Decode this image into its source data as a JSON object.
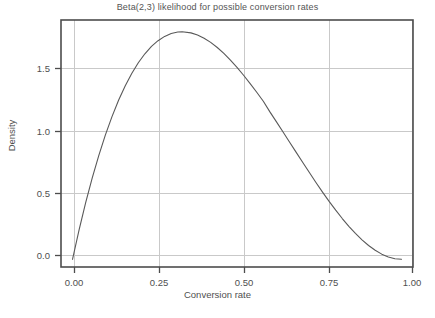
{
  "chart_data": {
    "type": "line",
    "title": "Beta(2,3) likelihood for possible conversion rates",
    "xlabel": "Conversion rate",
    "ylabel": "Density",
    "xlim": [
      -0.035,
      1.035
    ],
    "ylim": [
      -0.06,
      1.87
    ],
    "grid": true,
    "legend": null,
    "distribution": {
      "name": "Beta",
      "alpha": 2,
      "beta": 3
    },
    "xticks": [
      0,
      0.25,
      0.5,
      0.75,
      1
    ],
    "xtick_labels": [
      "0.00",
      "0.25",
      "0.50",
      "0.75",
      "1.00"
    ],
    "yticks": [
      0,
      0.5,
      1,
      1.5
    ],
    "ytick_labels": [
      "0.0",
      "0.5",
      "1.0",
      "1.5"
    ],
    "series": [
      {
        "name": "Beta(2,3) density",
        "color": "#595959",
        "x": [
          0,
          0.02,
          0.04,
          0.06,
          0.08,
          0.1,
          0.12,
          0.14,
          0.16,
          0.18,
          0.2,
          0.22,
          0.24,
          0.26,
          0.28,
          0.3,
          0.32,
          0.3333,
          0.36,
          0.38,
          0.4,
          0.42,
          0.44,
          0.46,
          0.48,
          0.5,
          0.52,
          0.54,
          0.56,
          0.58,
          0.6,
          0.62,
          0.64,
          0.66,
          0.68,
          0.7,
          0.72,
          0.74,
          0.76,
          0.78,
          0.8,
          0.82,
          0.84,
          0.86,
          0.88,
          0.9,
          0.92,
          0.94,
          0.96,
          0.98,
          1
        ],
        "y": [
          0,
          0.2305,
          0.4424,
          0.6362,
          0.8125,
          0.972,
          1.1151,
          1.2425,
          1.3547,
          1.4522,
          1.536,
          1.6061,
          1.6634,
          1.7084,
          1.7418,
          1.764,
          1.7757,
          1.7778,
          1.7694,
          1.7528,
          1.728,
          1.6952,
          1.6552,
          1.6087,
          1.5561,
          1.5,
          1.4382,
          1.3731,
          1.3052,
          1.2352,
          1.152,
          1.0736,
          0.9953,
          0.9151,
          0.8356,
          0.756,
          0.678,
          0.6006,
          0.5251,
          0.4529,
          0.384,
          0.3187,
          0.258,
          0.2024,
          0.1521,
          0.108,
          0.0706,
          0.0406,
          0.0184,
          0.0047,
          0
        ]
      }
    ]
  },
  "axes": {
    "title": "Beta(2,3) likelihood for possible conversion rates",
    "xlabel": "Conversion rate",
    "ylabel": "Density",
    "xtick_0": "0.00",
    "xtick_1": "0.25",
    "xtick_2": "0.50",
    "xtick_3": "0.75",
    "xtick_4": "1.00",
    "ytick_0": "0.0",
    "ytick_1": "0.5",
    "ytick_2": "1.0",
    "ytick_3": "1.5"
  },
  "style": {
    "line_color": "#595959",
    "grid_color": "#c9c9c9",
    "frame_color": "#4d4d4d",
    "background": "#ffffff",
    "text_color": "#4f4f4f"
  }
}
